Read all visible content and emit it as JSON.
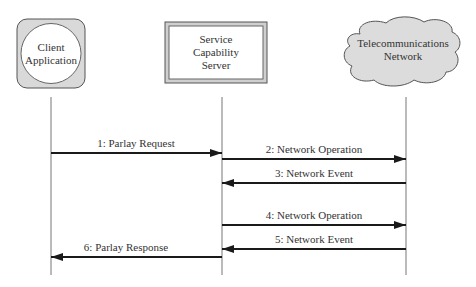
{
  "diagram": {
    "type": "sequence-diagram",
    "participants": [
      {
        "id": "client",
        "label_lines": [
          "Client",
          "Application"
        ],
        "shape": "circle-in-rounded-square",
        "fill": "#d9d9d9"
      },
      {
        "id": "scs",
        "label_lines": [
          "Service",
          "Capability",
          "Server"
        ],
        "shape": "beveled-rectangle",
        "fill": "#d9d9d9"
      },
      {
        "id": "network",
        "label_lines": [
          "Telecommunications",
          "Network"
        ],
        "shape": "cloud",
        "fill": "#dcdcdc"
      }
    ],
    "messages": [
      {
        "label": "1: Parlay Request",
        "from": "client",
        "to": "scs"
      },
      {
        "label": "2: Network Operation",
        "from": "scs",
        "to": "network"
      },
      {
        "label": "3: Network Event",
        "from": "network",
        "to": "scs"
      },
      {
        "label": "4: Network Operation",
        "from": "scs",
        "to": "network"
      },
      {
        "label": "5: Network Event",
        "from": "network",
        "to": "scs"
      },
      {
        "label": "6: Parlay Response",
        "from": "scs",
        "to": "client"
      }
    ],
    "colors": {
      "line": "#222222",
      "lifeline": "#777777",
      "text": "#333333"
    }
  }
}
